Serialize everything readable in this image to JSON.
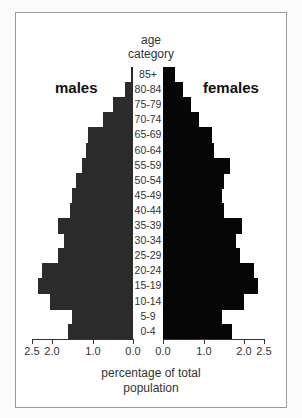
{
  "chart_data": {
    "type": "bar",
    "subtype": "population-pyramid",
    "xlabel": "percentage of total population",
    "ylabel": "age category",
    "categories": [
      "85+",
      "80-84",
      "75-79",
      "70-74",
      "65-69",
      "60-64",
      "55-59",
      "50-54",
      "45-49",
      "40-44",
      "35-39",
      "30-34",
      "25-29",
      "20-24",
      "15-19",
      "10-14",
      "5-9",
      "0-4"
    ],
    "series": [
      {
        "name": "males",
        "color": "#2b2b2b",
        "values": [
          0.05,
          0.2,
          0.5,
          0.75,
          1.1,
          1.15,
          1.25,
          1.4,
          1.5,
          1.55,
          1.85,
          1.7,
          1.85,
          2.25,
          2.35,
          2.05,
          1.5,
          1.6
        ]
      },
      {
        "name": "females",
        "color": "#060606",
        "values": [
          0.3,
          0.5,
          0.7,
          0.9,
          1.2,
          1.25,
          1.65,
          1.5,
          1.45,
          1.5,
          1.95,
          1.8,
          1.9,
          2.25,
          2.35,
          2.0,
          1.45,
          1.7
        ]
      }
    ],
    "xlim": [
      0,
      2.5
    ],
    "x_ticks_males": [
      "2.5",
      "2.0",
      "1.0",
      "0.0"
    ],
    "x_ticks_females": [
      "0.0",
      "1.0",
      "2.0",
      "2.5"
    ],
    "grid": false,
    "legend": "side labels (males left, females right)"
  },
  "labels": {
    "title_line1": "age",
    "title_line2": "category",
    "males": "males",
    "females": "females",
    "xlabel_line1": "percentage of total",
    "xlabel_line2": "population"
  }
}
